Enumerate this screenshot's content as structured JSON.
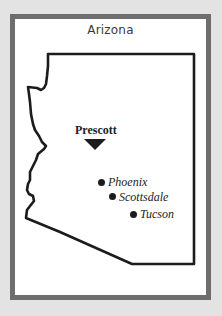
{
  "map": {
    "title": "Arizona",
    "colors": {
      "background": "#e3e3e3",
      "frame_border": "#6e6e6e",
      "panel": "#ffffff",
      "outline": "#1c1c1c"
    },
    "highlighted_city": {
      "name": "Prescott",
      "marker": "triangle-down-icon"
    },
    "cities": [
      {
        "name": "Phoenix",
        "marker": "dot-icon"
      },
      {
        "name": "Scottsdale",
        "marker": "dot-icon"
      },
      {
        "name": "Tucson",
        "marker": "dot-icon"
      }
    ]
  }
}
